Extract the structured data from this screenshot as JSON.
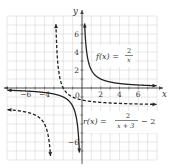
{
  "chart_data": {
    "type": "line",
    "title": "",
    "xlabel": "x",
    "ylabel": "y",
    "xlim": [
      -8,
      8
    ],
    "ylim": [
      -8,
      8
    ],
    "grid": true,
    "x_ticks": [
      -6,
      -4,
      2,
      4,
      6
    ],
    "y_ticks": [
      6,
      4,
      2,
      -6
    ],
    "origin_label": "0",
    "series": [
      {
        "name": "f(x) = 2/x",
        "label_parts": {
          "lhs": "f(x) =",
          "num": "2",
          "den": "x",
          "tail": ""
        },
        "style": "solid",
        "color": "#222222",
        "formula": "2/x",
        "vertical_asymptote": 0,
        "horizontal_asymptote": 0,
        "sample_points": [
          [
            -8,
            -0.25
          ],
          [
            -4,
            -0.5
          ],
          [
            -2,
            -1
          ],
          [
            -1,
            -2
          ],
          [
            -0.5,
            -4
          ],
          [
            -0.27,
            -7.5
          ],
          [
            0.27,
            7.5
          ],
          [
            0.5,
            4
          ],
          [
            1,
            2
          ],
          [
            2,
            1
          ],
          [
            4,
            0.5
          ],
          [
            8,
            0.25
          ]
        ]
      },
      {
        "name": "r(x) = 2/(x+3) - 2",
        "label_parts": {
          "lhs": "r(x) =",
          "num": "2",
          "den": "x + 3",
          "tail": "− 2"
        },
        "style": "dashed",
        "color": "#222222",
        "formula": "2/(x+3)-2",
        "vertical_asymptote": -3,
        "horizontal_asymptote": -2,
        "sample_points": [
          [
            -8,
            -2.4
          ],
          [
            -6,
            -2.67
          ],
          [
            -5,
            -3
          ],
          [
            -4,
            -4
          ],
          [
            -3.5,
            -6
          ],
          [
            -3.33,
            -8
          ],
          [
            -2.8,
            8
          ],
          [
            -2.5,
            2
          ],
          [
            -2,
            0
          ],
          [
            -1,
            -1
          ],
          [
            0,
            -1.33
          ],
          [
            2,
            -1.6
          ],
          [
            4,
            -1.71
          ],
          [
            8,
            -1.82
          ]
        ]
      }
    ]
  }
}
